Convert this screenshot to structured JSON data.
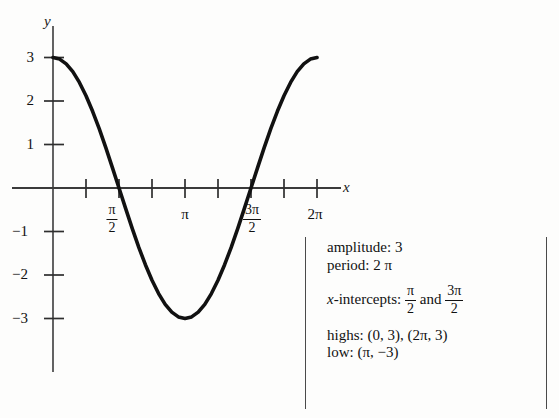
{
  "axes": {
    "x_letter": "x",
    "y_letter": "y",
    "x_label_name": "x-axis-label",
    "y_label_name": "y-axis-label",
    "y_ticks": [
      {
        "label": "3",
        "value": 3
      },
      {
        "label": "2",
        "value": 2
      },
      {
        "label": "1",
        "value": 1
      },
      {
        "label": "−1",
        "value": -1
      },
      {
        "label": "−2",
        "value": -2
      },
      {
        "label": "−3",
        "value": -3
      }
    ],
    "x_ticks": [
      {
        "label": "",
        "value": 0
      },
      {
        "label": "",
        "value": 0.7853981634
      },
      {
        "label": "pi/2",
        "value": 1.5707963268,
        "numerator": "π",
        "denominator": "2"
      },
      {
        "label": "",
        "value": 2.3561944902
      },
      {
        "label": "pi",
        "value": 3.1415926536,
        "plain": "π"
      },
      {
        "label": "",
        "value": 3.926990817
      },
      {
        "label": "3pi/2",
        "value": 4.7123889804,
        "numerator": "3π",
        "denominator": "2"
      },
      {
        "label": "",
        "value": 5.4977871438
      },
      {
        "label": "2pi",
        "value": 6.2831853072,
        "plain": "2π"
      }
    ],
    "xlim": [
      -0.35,
      6.95
    ],
    "ylim": [
      -3.75,
      3.6
    ],
    "grid": false
  },
  "chart_data": {
    "type": "line",
    "title": "",
    "xlabel": "x",
    "ylabel": "y",
    "xlim": [
      -0.35,
      6.95
    ],
    "ylim": [
      -3.75,
      3.6
    ],
    "grid": false,
    "legend_position": "right",
    "series": [
      {
        "name": "y = 3 cos x",
        "equation": "y = 3 cos x",
        "color": "#111111",
        "x": [
          0,
          0.1571,
          0.3142,
          0.4712,
          0.6283,
          0.7854,
          0.9425,
          1.0996,
          1.2566,
          1.4137,
          1.5708,
          1.7279,
          1.885,
          2.042,
          2.1991,
          2.3562,
          2.5133,
          2.6704,
          2.8274,
          2.9845,
          3.1416,
          3.2987,
          3.4558,
          3.6128,
          3.7699,
          3.927,
          4.0841,
          4.2412,
          4.3982,
          4.5553,
          4.7124,
          4.8695,
          5.0265,
          5.1836,
          5.3407,
          5.4978,
          5.6549,
          5.8119,
          5.969,
          6.1261,
          6.2832
        ],
        "y": [
          3.0,
          2.963,
          2.853,
          2.674,
          2.427,
          2.121,
          1.763,
          1.365,
          0.927,
          0.469,
          0.0,
          -0.469,
          -0.927,
          -1.365,
          -1.763,
          -2.121,
          -2.427,
          -2.674,
          -2.853,
          -2.963,
          -3.0,
          -2.963,
          -2.853,
          -2.674,
          -2.427,
          -2.121,
          -1.763,
          -1.365,
          -0.927,
          -0.469,
          0.0,
          0.469,
          0.927,
          1.365,
          1.763,
          2.121,
          2.427,
          2.674,
          2.853,
          2.963,
          3.0
        ]
      }
    ],
    "annotations": {
      "amplitude": 3,
      "period": "2π",
      "x_intercepts": [
        "π/2",
        "3π/2"
      ],
      "highs": [
        [
          0,
          3
        ],
        [
          "2π",
          3
        ]
      ],
      "low": [
        "π",
        -3
      ]
    }
  },
  "legend": {
    "amplitude": {
      "label": "amplitude:",
      "value": "3"
    },
    "period": {
      "label": "period:",
      "value": "2 π"
    },
    "x_intercepts": {
      "label_italic": "x",
      "label_rest": "-intercepts:",
      "first": {
        "numerator": "π",
        "denominator": "2"
      },
      "conjunction": "and",
      "second": {
        "numerator": "3π",
        "denominator": "2"
      }
    },
    "highs": {
      "label": "highs:",
      "value": "(0, 3), (2π, 3)"
    },
    "low": {
      "label": "low:",
      "value": "(π, −3)"
    }
  }
}
